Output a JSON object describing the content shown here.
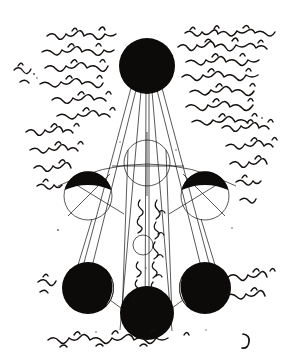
{
  "document": {
    "kind": "manuscript-folio-scan",
    "script": "Arabic naskh, handwritten, black ink",
    "reading_direction": "right-to-left",
    "background_color": "#ffffff",
    "ink_color": "#0d0b0a",
    "page_mark": "ر",
    "caption_vertical": "الخط المار بالمركز"
  },
  "text_blocks": [
    {
      "name": "upper-right-block",
      "position": "top-right",
      "lines": [
        "ـنبين حكماء الهند مه ونحن نبين الحال",
        "سماء العالم اذ ورنصف الجو مضىء",
        "باب العين نحلت ضلالة ح",
        "نه المضاء ودرار مين نصه",
        "ناند اخل النف لا اذ نبلو"
      ]
    },
    {
      "name": "upper-left-block",
      "position": "top-left",
      "lines": [
        "شـه وانـه رحما لهـذبك",
        "بابها مكينق مخوفة",
        "بالمكتوبة الاستقف الا",
        "نحلام نحل بوبه",
        "هـذه محدو والفتاد"
      ]
    },
    {
      "name": "left-margin-block",
      "position": "middle-left",
      "lines": [
        "واه سنخداميخ",
        "منعـا نصـ",
        "ـنه"
      ]
    },
    {
      "name": "right-margin-block",
      "position": "middle-right",
      "lines": [
        "بابـد البهـد ونيـه نالـ",
        "نخـاب بـد ونبـه",
        "نـحـمــه"
      ]
    },
    {
      "name": "lower-left-note",
      "position": "lower-left",
      "lines": [
        "وبنه"
      ]
    },
    {
      "name": "lower-right-note",
      "position": "lower-right",
      "lines": [
        "ـسـنجتـئـنـه",
        "لقنــفـانـه"
      ]
    },
    {
      "name": "bottom-line",
      "position": "bottom",
      "lines": [
        "فنتمونقفه حـنـه نـه نا سـحـمـنـه مهايـخ"
      ]
    },
    {
      "name": "diagram-caption-left",
      "position": "diagram-center-left",
      "orientation": "vertical",
      "lines": [
        "نـقـطـه"
      ]
    },
    {
      "name": "diagram-caption-right",
      "position": "diagram-center-right",
      "orientation": "vertical",
      "lines": [
        "الخط المـار بالمركـز"
      ]
    }
  ],
  "diagram": {
    "name": "lunar-phase-sight-line-diagram",
    "elements": {
      "bodies": [
        {
          "id": "body-top",
          "label": "top",
          "cx": 147,
          "cy": 66,
          "r": 28,
          "phase": "full-dark"
        },
        {
          "id": "body-mid-left",
          "label": "middle-left",
          "cx": 88,
          "cy": 196,
          "r": 24,
          "phase": "upper-half-dark"
        },
        {
          "id": "body-mid-right",
          "label": "middle-right",
          "cx": 205,
          "cy": 196,
          "r": 24,
          "phase": "upper-half-dark"
        },
        {
          "id": "body-lower-left",
          "label": "lower-left",
          "cx": 88,
          "cy": 288,
          "r": 26,
          "phase": "dark-with-crescent"
        },
        {
          "id": "body-lower-right",
          "label": "lower-right",
          "cx": 205,
          "cy": 288,
          "r": 26,
          "phase": "dark-with-crescent"
        },
        {
          "id": "body-bottom",
          "label": "bottom",
          "cx": 147,
          "cy": 313,
          "r": 27,
          "phase": "full-dark"
        },
        {
          "id": "body-centre",
          "label": "centre",
          "cx": 147,
          "cy": 163,
          "r": 23,
          "phase": "outline-only"
        }
      ],
      "small_circle": {
        "id": "node-circle",
        "cx": 143,
        "cy": 245,
        "r": 10
      },
      "axes": {
        "vertical": true,
        "horizontal": true
      },
      "great_arc": {
        "description": "wide shallow arc sweeping through the centre circle"
      },
      "sight_lines_count": 8
    }
  }
}
